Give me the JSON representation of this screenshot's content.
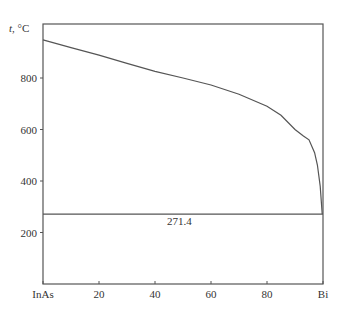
{
  "chart_data": {
    "type": "line",
    "title": "",
    "xlabel": "",
    "ylabel": "t, °C",
    "xlim": [
      0,
      100
    ],
    "ylim": [
      0,
      1000
    ],
    "x_ticks": [
      {
        "value": 0,
        "label": "InAs"
      },
      {
        "value": 20,
        "label": "20"
      },
      {
        "value": 40,
        "label": "40"
      },
      {
        "value": 60,
        "label": "60"
      },
      {
        "value": 80,
        "label": "80"
      },
      {
        "value": 100,
        "label": "Bi"
      }
    ],
    "y_ticks": [
      {
        "value": 200,
        "label": "200"
      },
      {
        "value": 400,
        "label": "400"
      },
      {
        "value": 600,
        "label": "600"
      },
      {
        "value": 800,
        "label": "800"
      }
    ],
    "grid": false,
    "series": [
      {
        "name": "liquidus",
        "x": [
          0,
          10,
          20,
          30,
          40,
          50,
          60,
          70,
          80,
          85,
          90,
          93,
          95,
          97,
          98,
          99,
          99.7
        ],
        "values": [
          948,
          918,
          889,
          857,
          826,
          800,
          773,
          737,
          690,
          655,
          600,
          575,
          560,
          510,
          462,
          380,
          272
        ]
      },
      {
        "name": "eutectic",
        "x": [
          0,
          100
        ],
        "values": [
          271.4,
          271.4
        ]
      }
    ],
    "annotations": [
      {
        "text": "271.4",
        "x": 46,
        "y": 240
      }
    ]
  }
}
